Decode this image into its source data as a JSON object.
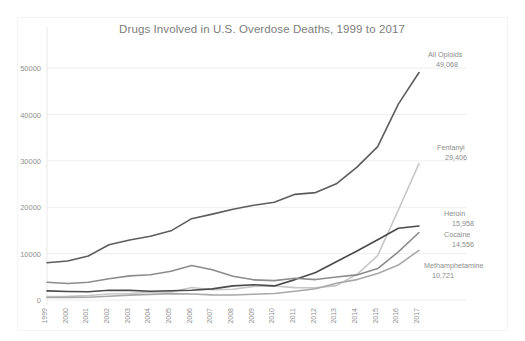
{
  "chart_data": {
    "type": "line",
    "title": "Drugs Involved in U.S. Overdose Deaths, 1999 to 2017",
    "xlabel": "",
    "ylabel": "",
    "ylim": [
      0,
      55000
    ],
    "yticks": [
      0,
      10000,
      20000,
      30000,
      40000,
      50000
    ],
    "ytick_labels": [
      "0",
      "10000",
      "20000",
      "30000",
      "40000",
      "50000"
    ],
    "grid": true,
    "legend_position": "end-of-line-labels",
    "categories": [
      1999,
      2000,
      2001,
      2002,
      2003,
      2004,
      2005,
      2006,
      2007,
      2008,
      2009,
      2010,
      2011,
      2012,
      2013,
      2014,
      2015,
      2016,
      2017
    ],
    "xtick_labels": [
      "1999",
      "2000",
      "2001",
      "2002",
      "2003",
      "2004",
      "2005",
      "2006",
      "2007",
      "2008",
      "2009",
      "2010",
      "2011",
      "2012",
      "2013",
      "2014",
      "2015",
      "2016",
      "2017"
    ],
    "series": [
      {
        "name": "All Opioids",
        "color": "#5d5d5d",
        "end_label": "All Opioids",
        "end_value_label": "49,068",
        "end_value": 49068,
        "values": [
          8048,
          8407,
          9496,
          11920,
          12940,
          13756,
          14918,
          17545,
          18516,
          19582,
          20422,
          21089,
          22784,
          23166,
          25052,
          28647,
          33091,
          42249,
          49068
        ]
      },
      {
        "name": "Fentanyl",
        "color": "#c7c7c7",
        "end_label": "Fentanyl",
        "end_value_label": "29,406",
        "end_value": 29406,
        "values": [
          730,
          782,
          957,
          1295,
          1400,
          1664,
          1742,
          2707,
          2213,
          2306,
          2946,
          3007,
          2666,
          2628,
          3105,
          5544,
          9580,
          19413,
          29406
        ]
      },
      {
        "name": "Heroin",
        "color": "#4a4a4a",
        "end_label": "Heroin",
        "end_value_label": "15,958",
        "end_value": 15958,
        "values": [
          1960,
          1842,
          1779,
          2089,
          2080,
          1878,
          2009,
          2088,
          2399,
          3041,
          3278,
          3036,
          4397,
          5925,
          8257,
          10574,
          12989,
          15469,
          15958
        ]
      },
      {
        "name": "Cocaine",
        "color": "#8c8c8c",
        "end_label": "Cocaine",
        "end_value_label": "14,556",
        "end_value": 14556,
        "values": [
          3822,
          3544,
          3833,
          4599,
          5196,
          5443,
          6208,
          7448,
          6512,
          5129,
          4350,
          4183,
          4681,
          4404,
          4944,
          5415,
          6784,
          10375,
          14556
        ]
      },
      {
        "name": "Methamphetamine",
        "color": "#a8a8a8",
        "end_label": "Methamphetamine",
        "end_value_label": "10,721",
        "end_value": 10721,
        "values": [
          547,
          573,
          586,
          818,
          1043,
          1204,
          1370,
          1299,
          1100,
          1080,
          1244,
          1388,
          1887,
          2440,
          3627,
          4402,
          5716,
          7542,
          10721
        ]
      }
    ],
    "annotations": [
      {
        "text": "All Opioids",
        "value": "49,068"
      },
      {
        "text": "Fentanyl",
        "value": "29,406"
      },
      {
        "text": "Heroin",
        "value": "15,958"
      },
      {
        "text": "Cocaine",
        "value": "14,556"
      },
      {
        "text": "Methamphetamine",
        "value": "10,721"
      }
    ]
  }
}
